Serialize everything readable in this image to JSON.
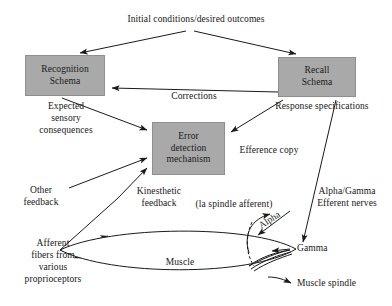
{
  "diagram": {
    "background_color": "#ffffff",
    "box_fill_color": "#a9a9a9",
    "line_color": "#1a1a1a",
    "nodes": [
      {
        "id": "recognition",
        "label": "Recognition\nSchema"
      },
      {
        "id": "recall",
        "label": "Recall\nSchema"
      },
      {
        "id": "error",
        "label": "Error\ndetection\nmechanism"
      },
      {
        "id": "muscle",
        "label": "Muscle"
      }
    ],
    "labels": {
      "title": "Initial conditions/desired outcomes",
      "corrections": "Corrections",
      "expected_sensory_consequences": "Expected\nsensory\nconsequences",
      "response_specifications": "Response specifications",
      "efference_copy": "Efference copy",
      "other_feedback": "Other\nfeedback",
      "kinesthetic_feedback": "Kinesthetic\nfeedback",
      "spindle_afferent": "(la spindle afferent)",
      "alpha_gamma_efferent": "Alpha/Gamma\nEfferent nerves",
      "afferent_fibers": "Afferent\nfibers from\nvarious\nproprioceptors",
      "muscle": "Muscle",
      "alpha": "Alpha",
      "gamma": "Gamma",
      "muscle_spindle": "Muscle spindle"
    }
  }
}
